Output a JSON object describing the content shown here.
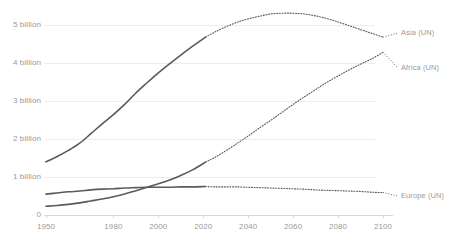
{
  "chart_data": {
    "type": "line",
    "title": "",
    "subtitle": "",
    "xlabel": "",
    "ylabel": "",
    "xlim": [
      1950,
      2100
    ],
    "ylim": [
      0,
      5500000000
    ],
    "grid": true,
    "legend_position": "right-inline",
    "x_tick_labels": [
      "1950",
      "1980",
      "2000",
      "2020",
      "2040",
      "2060",
      "2080",
      "2100"
    ],
    "x_ticks": [
      1950,
      1980,
      2000,
      2020,
      2040,
      2060,
      2080,
      2100
    ],
    "y_tick_labels": [
      "0",
      "1 billion",
      "2 billion",
      "3 billion",
      "4 billion",
      "5 billion"
    ],
    "y_ticks": [
      0,
      1000000000,
      2000000000,
      3000000000,
      4000000000,
      5000000000
    ],
    "historical_end_year": 2021,
    "colors": {
      "line": "#5a5a5a",
      "grid": "#ededed",
      "axis": "#d8d8d8",
      "text": "#9a9a9a"
    },
    "series": [
      {
        "name": "Asia (UN)",
        "label": "Asia (UN)",
        "x": [
          1950,
          1955,
          1960,
          1965,
          1970,
          1975,
          1980,
          1985,
          1990,
          1995,
          2000,
          2005,
          2010,
          2015,
          2021,
          2025,
          2030,
          2035,
          2040,
          2045,
          2050,
          2055,
          2060,
          2065,
          2070,
          2075,
          2080,
          2085,
          2090,
          2095,
          2100
        ],
        "values": [
          1.4,
          1.54,
          1.7,
          1.89,
          2.14,
          2.4,
          2.64,
          2.91,
          3.21,
          3.48,
          3.74,
          3.98,
          4.21,
          4.43,
          4.68,
          4.81,
          4.95,
          5.07,
          5.16,
          5.23,
          5.29,
          5.31,
          5.31,
          5.29,
          5.24,
          5.17,
          5.08,
          4.98,
          4.88,
          4.78,
          4.68
        ],
        "unit": "billion",
        "style_historical": "solid",
        "style_projection": "dotted"
      },
      {
        "name": "Africa (UN)",
        "label": "Africa (UN)",
        "x": [
          1950,
          1955,
          1960,
          1965,
          1970,
          1975,
          1980,
          1985,
          1990,
          1995,
          2000,
          2005,
          2010,
          2015,
          2021,
          2025,
          2030,
          2035,
          2040,
          2045,
          2050,
          2055,
          2060,
          2065,
          2070,
          2075,
          2080,
          2085,
          2090,
          2095,
          2100
        ],
        "values": [
          0.23,
          0.25,
          0.28,
          0.32,
          0.37,
          0.42,
          0.48,
          0.55,
          0.64,
          0.73,
          0.82,
          0.92,
          1.04,
          1.18,
          1.39,
          1.51,
          1.69,
          1.88,
          2.08,
          2.29,
          2.49,
          2.7,
          2.91,
          3.11,
          3.3,
          3.49,
          3.66,
          3.82,
          3.97,
          4.11,
          4.28
        ],
        "unit": "billion",
        "style_historical": "solid",
        "style_projection": "dotted"
      },
      {
        "name": "Europe (UN)",
        "label": "Europe (UN)",
        "x": [
          1950,
          1955,
          1960,
          1965,
          1970,
          1975,
          1980,
          1985,
          1990,
          1995,
          2000,
          2005,
          2010,
          2015,
          2021,
          2025,
          2030,
          2035,
          2040,
          2045,
          2050,
          2055,
          2060,
          2065,
          2070,
          2075,
          2080,
          2085,
          2090,
          2095,
          2100
        ],
        "values": [
          0.55,
          0.58,
          0.61,
          0.63,
          0.66,
          0.68,
          0.69,
          0.71,
          0.72,
          0.73,
          0.73,
          0.73,
          0.74,
          0.74,
          0.75,
          0.74,
          0.74,
          0.74,
          0.73,
          0.72,
          0.71,
          0.7,
          0.69,
          0.68,
          0.66,
          0.65,
          0.64,
          0.63,
          0.62,
          0.6,
          0.59
        ],
        "unit": "billion",
        "style_historical": "solid",
        "style_projection": "dotted"
      }
    ]
  }
}
